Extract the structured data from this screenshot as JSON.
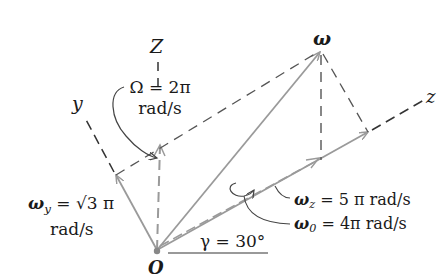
{
  "diagram": {
    "axes": {
      "Z": "Z",
      "y": "y",
      "z": "z",
      "origin": "O"
    },
    "vectors": {
      "omega": {
        "label": "ω"
      },
      "Omega": {
        "line1": "Ω = 2π",
        "line2": "rad/s"
      },
      "omega_y": {
        "symbol": "ω",
        "subscript": "y",
        "value": " = √3 π",
        "unit": "rad/s"
      },
      "omega_z": {
        "symbol": "ω",
        "subscript": "z",
        "value": " = 5 π rad/s"
      },
      "omega_0": {
        "symbol": "ω",
        "subscript": "0",
        "value": " = 4π rad/s"
      }
    },
    "angle": {
      "label": "γ = 30°"
    },
    "colors": {
      "vector": "#9a9a9a",
      "dashed": "#555555",
      "text": "#1a1a1a"
    }
  }
}
